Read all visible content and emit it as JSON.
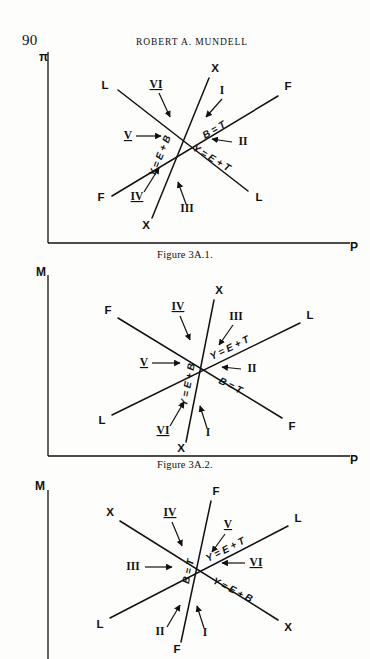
{
  "page": {
    "number": "90",
    "running_head": "ROBERT A. MUNDELL",
    "ink_color": "#111111",
    "paper_color": "#fdfdfb"
  },
  "figures": [
    {
      "id": "fig-3a-1",
      "caption": "Figure 3A.1.",
      "axes": {
        "y_label": "π",
        "x_label": "P"
      },
      "line_endpoints": [
        {
          "name": "L-line-upper-left",
          "label": "L"
        },
        {
          "name": "L-line-lower-right",
          "label": "L"
        },
        {
          "name": "F-line-lower-left",
          "label": "F"
        },
        {
          "name": "F-line-upper-right",
          "label": "F"
        },
        {
          "name": "X-line-upper-right",
          "label": "X"
        },
        {
          "name": "X-line-lower-left",
          "label": "X"
        }
      ],
      "curve_labels": [
        {
          "name": "y-equals-e-plus-b",
          "text": "Y = E + B"
        },
        {
          "name": "b-equals-t",
          "text": "B = T"
        },
        {
          "name": "y-equals-e-plus-t",
          "text": "Y = E + T"
        }
      ],
      "regions": [
        {
          "name": "region-I",
          "text": "I",
          "underlined": false
        },
        {
          "name": "region-II",
          "text": "II",
          "underlined": false
        },
        {
          "name": "region-III",
          "text": "III",
          "underlined": false
        },
        {
          "name": "region-IV",
          "text": "IV",
          "underlined": true
        },
        {
          "name": "region-V",
          "text": "V",
          "underlined": true
        },
        {
          "name": "region-VI",
          "text": "VI",
          "underlined": true
        }
      ]
    },
    {
      "id": "fig-3a-2",
      "caption": "Figure 3A.2.",
      "axes": {
        "y_label": "M",
        "x_label": "P"
      },
      "line_endpoints": [
        {
          "name": "F-line-upper-left",
          "label": "F"
        },
        {
          "name": "F-line-lower-right",
          "label": "F"
        },
        {
          "name": "L-line-lower-left",
          "label": "L"
        },
        {
          "name": "L-line-upper-right",
          "label": "L"
        },
        {
          "name": "X-line-upper-right",
          "label": "X"
        },
        {
          "name": "X-line-lower-left",
          "label": "X"
        }
      ],
      "curve_labels": [
        {
          "name": "y-equals-e-plus-b",
          "text": "Y = E + B"
        },
        {
          "name": "y-equals-e-plus-t",
          "text": "Y = E + T"
        },
        {
          "name": "b-equals-t",
          "text": "B = T"
        }
      ],
      "regions": [
        {
          "name": "region-I",
          "text": "I",
          "underlined": false
        },
        {
          "name": "region-II",
          "text": "II",
          "underlined": false
        },
        {
          "name": "region-III",
          "text": "III",
          "underlined": false
        },
        {
          "name": "region-IV",
          "text": "IV",
          "underlined": true
        },
        {
          "name": "region-V",
          "text": "V",
          "underlined": true
        },
        {
          "name": "region-VI",
          "text": "VI",
          "underlined": true
        }
      ]
    },
    {
      "id": "fig-3a-3",
      "caption": "",
      "axes": {
        "y_label": "M",
        "x_label": ""
      },
      "line_endpoints": [
        {
          "name": "X-line-upper-left",
          "label": "X"
        },
        {
          "name": "X-line-lower-right",
          "label": "X"
        },
        {
          "name": "L-line-lower-left",
          "label": "L"
        },
        {
          "name": "L-line-upper-right",
          "label": "L"
        },
        {
          "name": "F-line-upper-right",
          "label": "F"
        },
        {
          "name": "F-line-lower-left",
          "label": "F"
        }
      ],
      "curve_labels": [
        {
          "name": "b-equals-t",
          "text": "B = T"
        },
        {
          "name": "y-equals-e-plus-t",
          "text": "Y = E + T"
        },
        {
          "name": "y-equals-e-plus-b",
          "text": "Y = E + B"
        }
      ],
      "regions": [
        {
          "name": "region-I",
          "text": "I",
          "underlined": false
        },
        {
          "name": "region-II",
          "text": "II",
          "underlined": false
        },
        {
          "name": "region-III",
          "text": "III",
          "underlined": false
        },
        {
          "name": "region-IV",
          "text": "IV",
          "underlined": true
        },
        {
          "name": "region-V",
          "text": "V",
          "underlined": true
        },
        {
          "name": "region-VI",
          "text": "VI",
          "underlined": true
        }
      ]
    }
  ]
}
